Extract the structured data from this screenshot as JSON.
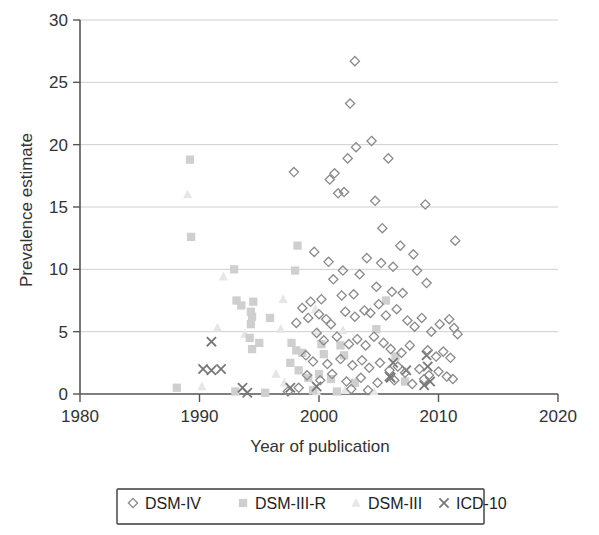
{
  "chart_data": {
    "type": "scatter",
    "title": "",
    "xlabel": "Year of publication",
    "ylabel": "Prevalence estimate",
    "xlim": [
      1980,
      2020
    ],
    "ylim": [
      0,
      30
    ],
    "xticks": [
      1980,
      1990,
      2000,
      2010,
      2020
    ],
    "yticks": [
      0,
      5,
      10,
      15,
      20,
      25,
      30
    ],
    "grid": "horizontal",
    "legend_position": "below-axis",
    "series": [
      {
        "name": "DSM-IV",
        "marker": "diamond",
        "color": "#8a8a8a",
        "points": [
          [
            2003.0,
            26.7
          ],
          [
            2002.6,
            23.3
          ],
          [
            2004.4,
            20.3
          ],
          [
            2003.1,
            19.8
          ],
          [
            2005.8,
            18.9
          ],
          [
            2002.4,
            18.9
          ],
          [
            1997.9,
            17.8
          ],
          [
            2001.3,
            17.7
          ],
          [
            2000.9,
            17.2
          ],
          [
            2004.7,
            15.5
          ],
          [
            2002.1,
            16.2
          ],
          [
            2001.6,
            16.1
          ],
          [
            2008.9,
            15.2
          ],
          [
            2011.4,
            12.3
          ],
          [
            1999.6,
            11.4
          ],
          [
            2005.3,
            13.3
          ],
          [
            2006.8,
            11.9
          ],
          [
            2007.9,
            11.2
          ],
          [
            2004.0,
            10.9
          ],
          [
            2005.2,
            10.5
          ],
          [
            2006.2,
            10.2
          ],
          [
            2008.2,
            9.9
          ],
          [
            2009.0,
            8.9
          ],
          [
            2002.0,
            9.9
          ],
          [
            2003.4,
            9.6
          ],
          [
            2000.8,
            10.6
          ],
          [
            2001.2,
            9.2
          ],
          [
            2004.8,
            8.6
          ],
          [
            2006.1,
            8.2
          ],
          [
            2007.0,
            8.1
          ],
          [
            2002.9,
            8.0
          ],
          [
            2001.9,
            7.9
          ],
          [
            2000.2,
            7.6
          ],
          [
            1999.3,
            7.4
          ],
          [
            1998.6,
            6.9
          ],
          [
            1998.1,
            5.7
          ],
          [
            1999.1,
            6.1
          ],
          [
            2000.0,
            6.4
          ],
          [
            2000.6,
            6.0
          ],
          [
            2001.0,
            5.6
          ],
          [
            2002.2,
            6.6
          ],
          [
            2003.0,
            6.2
          ],
          [
            2003.8,
            6.7
          ],
          [
            2004.3,
            6.5
          ],
          [
            2005.0,
            7.2
          ],
          [
            2005.6,
            6.3
          ],
          [
            2006.5,
            6.8
          ],
          [
            2007.4,
            5.9
          ],
          [
            2008.0,
            5.4
          ],
          [
            2008.6,
            6.1
          ],
          [
            2009.4,
            5.0
          ],
          [
            2010.1,
            5.6
          ],
          [
            2010.9,
            6.0
          ],
          [
            2011.3,
            5.3
          ],
          [
            2011.6,
            4.8
          ],
          [
            1999.8,
            4.9
          ],
          [
            2000.4,
            4.3
          ],
          [
            2001.5,
            4.6
          ],
          [
            2002.5,
            4.0
          ],
          [
            2003.2,
            4.4
          ],
          [
            2003.9,
            3.9
          ],
          [
            2004.6,
            4.6
          ],
          [
            2005.4,
            4.1
          ],
          [
            2006.0,
            3.6
          ],
          [
            2006.9,
            3.3
          ],
          [
            2007.6,
            3.9
          ],
          [
            2009.1,
            3.5
          ],
          [
            2009.8,
            3.0
          ],
          [
            2010.4,
            3.4
          ],
          [
            2011.0,
            2.9
          ],
          [
            1998.9,
            3.1
          ],
          [
            1999.5,
            2.6
          ],
          [
            2000.7,
            2.4
          ],
          [
            2001.8,
            2.8
          ],
          [
            2002.8,
            2.3
          ],
          [
            2003.6,
            2.7
          ],
          [
            2004.2,
            2.1
          ],
          [
            2005.1,
            2.5
          ],
          [
            2005.9,
            1.9
          ],
          [
            2006.6,
            2.2
          ],
          [
            2007.2,
            1.7
          ],
          [
            2008.4,
            2.0
          ],
          [
            2009.2,
            1.5
          ],
          [
            2010.0,
            1.8
          ],
          [
            2010.7,
            1.4
          ],
          [
            2011.2,
            1.2
          ],
          [
            1999.0,
            1.5
          ],
          [
            2000.1,
            1.1
          ],
          [
            2001.1,
            1.6
          ],
          [
            2002.3,
            1.0
          ],
          [
            2003.5,
            1.3
          ],
          [
            2004.9,
            0.9
          ],
          [
            2006.3,
            1.1
          ],
          [
            2007.8,
            0.8
          ],
          [
            2008.8,
            1.2
          ],
          [
            2002.7,
            0.4
          ],
          [
            2004.1,
            0.3
          ],
          [
            1998.3,
            0.5
          ],
          [
            1997.4,
            0.2
          ]
        ]
      },
      {
        "name": "DSM-III-R",
        "marker": "square",
        "color": "#cfcfcf",
        "points": [
          [
            1989.2,
            18.8
          ],
          [
            1989.3,
            12.6
          ],
          [
            1998.2,
            11.9
          ],
          [
            1992.9,
            10.0
          ],
          [
            1998.0,
            9.9
          ],
          [
            1993.1,
            7.5
          ],
          [
            1994.5,
            7.4
          ],
          [
            1993.5,
            7.1
          ],
          [
            1994.3,
            6.6
          ],
          [
            1994.4,
            6.2
          ],
          [
            1994.3,
            5.6
          ],
          [
            1995.9,
            6.1
          ],
          [
            2005.6,
            7.5
          ],
          [
            2004.8,
            5.2
          ],
          [
            1994.2,
            4.5
          ],
          [
            1995.0,
            4.1
          ],
          [
            1994.4,
            3.6
          ],
          [
            1997.7,
            4.1
          ],
          [
            1998.1,
            3.5
          ],
          [
            1998.6,
            3.3
          ],
          [
            2000.2,
            4.0
          ],
          [
            2000.4,
            3.2
          ],
          [
            2001.8,
            3.9
          ],
          [
            2002.1,
            3.1
          ],
          [
            2006.4,
            3.0
          ],
          [
            1997.6,
            2.5
          ],
          [
            1998.3,
            1.9
          ],
          [
            1999.1,
            1.3
          ],
          [
            2000.0,
            1.6
          ],
          [
            2001.0,
            1.2
          ],
          [
            2003.0,
            0.9
          ],
          [
            2007.2,
            1.0
          ],
          [
            1988.1,
            0.5
          ],
          [
            1993.0,
            0.2
          ],
          [
            1995.5,
            0.1
          ],
          [
            1999.5,
            0.3
          ],
          [
            2001.5,
            0.2
          ]
        ]
      },
      {
        "name": "DSM-III",
        "marker": "triangle",
        "color": "#e6e6e6",
        "points": [
          [
            1989.0,
            16.0
          ],
          [
            1992.0,
            9.4
          ],
          [
            1991.5,
            5.3
          ],
          [
            1993.8,
            4.8
          ],
          [
            1997.0,
            7.6
          ],
          [
            1996.8,
            5.2
          ],
          [
            1999.7,
            6.8
          ],
          [
            1999.9,
            5.0
          ],
          [
            2002.0,
            5.1
          ],
          [
            1996.4,
            1.6
          ],
          [
            1997.1,
            0.9
          ],
          [
            1990.2,
            0.6
          ],
          [
            1999.8,
            0.2
          ],
          [
            2002.2,
            0.3
          ],
          [
            2004.6,
            0.2
          ]
        ]
      },
      {
        "name": "ICD-10",
        "marker": "cross",
        "color": "#777777",
        "points": [
          [
            1991.0,
            4.2
          ],
          [
            1990.3,
            2.0
          ],
          [
            1991.0,
            1.9
          ],
          [
            1991.8,
            2.0
          ],
          [
            1993.6,
            0.5
          ],
          [
            1994.0,
            0.1
          ],
          [
            1997.6,
            0.5
          ],
          [
            1999.8,
            0.6
          ],
          [
            2006.2,
            2.5
          ],
          [
            2007.3,
            1.9
          ],
          [
            2009.0,
            3.1
          ],
          [
            2009.1,
            2.2
          ],
          [
            2009.3,
            1.0
          ],
          [
            2005.9,
            1.4
          ],
          [
            2006.0,
            1.3
          ],
          [
            2008.8,
            0.7
          ]
        ]
      }
    ]
  },
  "axes": {
    "x_tick_labels": [
      "1980",
      "1990",
      "2000",
      "2010",
      "2020"
    ],
    "y_tick_labels": [
      "0",
      "5",
      "10",
      "15",
      "20",
      "25",
      "30"
    ],
    "x_axis_title": "Year of publication",
    "y_axis_title": "Prevalence estimate"
  },
  "legend": {
    "entries": [
      {
        "label": "DSM-IV",
        "marker": "diamond",
        "color": "#8a8a8a"
      },
      {
        "label": "DSM-III-R",
        "marker": "square",
        "color": "#cfcfcf"
      },
      {
        "label": "DSM-III",
        "marker": "triangle",
        "color": "#e6e6e6"
      },
      {
        "label": "ICD-10",
        "marker": "cross",
        "color": "#777777"
      }
    ]
  }
}
